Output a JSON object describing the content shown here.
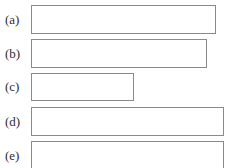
{
  "items": [
    {
      "label": "(a)",
      "value": ""
    },
    {
      "label": "(b)",
      "value": ""
    },
    {
      "label": "(c)",
      "value": ""
    },
    {
      "label": "(d)",
      "value": ""
    },
    {
      "label": "(e)",
      "value": ""
    }
  ]
}
